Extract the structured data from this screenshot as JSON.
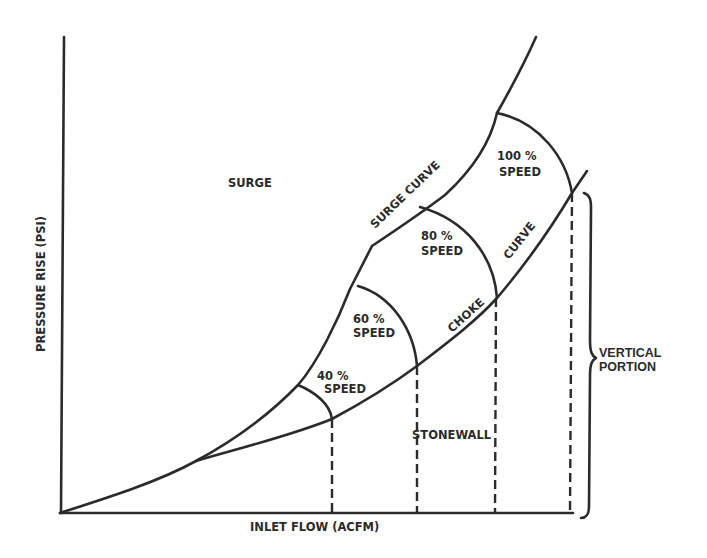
{
  "diagram": {
    "axes": {
      "y_label": "PRESSURE RISE (PSI)",
      "x_label": "INLET FLOW (ACFM)"
    },
    "regions": {
      "surge": "SURGE",
      "stonewall": "STONEWALL"
    },
    "curves": {
      "surge_curve": "SURGE CURVE",
      "choke_word1": "CHOKE",
      "choke_word2": "CURVE"
    },
    "speed_lines": [
      {
        "percent": "40 %",
        "label": "SPEED"
      },
      {
        "percent": "60 %",
        "label": "SPEED"
      },
      {
        "percent": "80 %",
        "label": "SPEED"
      },
      {
        "percent": "100 %",
        "label": "SPEED"
      }
    ],
    "brace": {
      "line1": "VERTICAL",
      "line2": "PORTION"
    },
    "colors": {
      "ink": "#2b2b2b",
      "background": "#ffffff"
    }
  }
}
